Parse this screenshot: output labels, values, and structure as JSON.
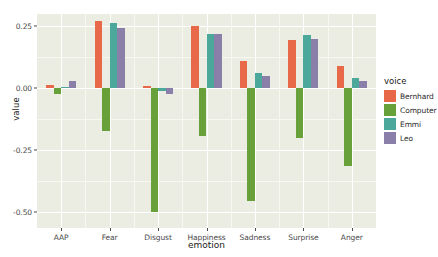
{
  "chart_data": {
    "type": "bar",
    "title": "",
    "xlabel": "emotion",
    "ylabel": "value",
    "categories": [
      "AAP",
      "Fear",
      "Disgust",
      "Happiness",
      "Sadness",
      "Surprise",
      "Anger"
    ],
    "series": [
      {
        "name": "Bernhard",
        "color": "#E8684A",
        "values": [
          0.012,
          0.27,
          0.01,
          0.25,
          0.11,
          0.195,
          0.09
        ]
      },
      {
        "name": "Computer",
        "color": "#68A13A",
        "values": [
          -0.022,
          -0.172,
          -0.5,
          -0.192,
          -0.455,
          -0.2,
          -0.315
        ]
      },
      {
        "name": "Emmi",
        "color": "#4BA89B",
        "values": [
          0.003,
          0.262,
          -0.012,
          0.22,
          0.062,
          0.215,
          0.04
        ]
      },
      {
        "name": "Leo",
        "color": "#8A7FA8",
        "values": [
          0.03,
          0.245,
          -0.025,
          0.22,
          0.05,
          0.2,
          0.03
        ]
      }
    ],
    "ylim": [
      -0.565,
      0.3
    ],
    "yticks": [
      0.25,
      0.0,
      -0.25,
      -0.5
    ],
    "ytick_labels": [
      "0.25",
      "0.00",
      "-0.25",
      "-0.50"
    ],
    "yminor": [
      0.125,
      -0.125,
      -0.375
    ],
    "grid": true,
    "legend": {
      "title": "voice",
      "position": "right",
      "entries": [
        {
          "label": "Bernhard",
          "color": "#E8684A"
        },
        {
          "label": "Computer",
          "color": "#68A13A"
        },
        {
          "label": "Emmi",
          "color": "#4BA89B"
        },
        {
          "label": "Leo",
          "color": "#8A7FA8"
        }
      ]
    },
    "panel_background": "#EBECE2",
    "gridline_color": "#FFFFFF"
  }
}
